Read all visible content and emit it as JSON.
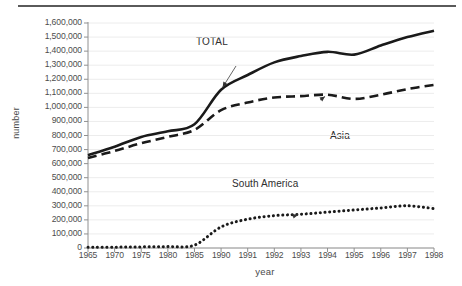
{
  "figure": {
    "has_top_rule": true,
    "background_color": "#ffffff",
    "line_color": "#1a1a1a",
    "grid_color": "#ececec",
    "axis_color": "#909090",
    "text_color": "#4d4d4d"
  },
  "chart_data": {
    "type": "line",
    "title": "",
    "xlabel": "year",
    "ylabel": "number",
    "grid": true,
    "legend_position": "inline-annotations",
    "ylim": [
      0,
      1600000
    ],
    "ytick_labels": [
      "1,600,000",
      "1,500,000",
      "1,400,000",
      "1,300,000",
      "1,200,000",
      "1,100,000",
      "1,000,000",
      "900,000",
      "800,000",
      "700,000",
      "600,000",
      "500,000",
      "400,000",
      "300,000",
      "200,000",
      "100,000",
      "0"
    ],
    "ytick_values": [
      1600000,
      1500000,
      1400000,
      1300000,
      1200000,
      1100000,
      1000000,
      900000,
      800000,
      700000,
      600000,
      500000,
      400000,
      300000,
      200000,
      100000,
      0
    ],
    "categories": [
      "1965",
      "1970",
      "1975",
      "1980",
      "1985",
      "1990",
      "1991",
      "1992",
      "1993",
      "1994",
      "1995",
      "1996",
      "1997",
      "1998"
    ],
    "x": [
      1965,
      1970,
      1975,
      1980,
      1985,
      1990,
      1991,
      1992,
      1993,
      1994,
      1995,
      1996,
      1997,
      1998
    ],
    "series": [
      {
        "name": "TOTAL",
        "style": "solid",
        "values": [
          660000,
          720000,
          790000,
          830000,
          880000,
          1125000,
          1230000,
          1320000,
          1365000,
          1395000,
          1375000,
          1440000,
          1500000,
          1545000
        ]
      },
      {
        "name": "Asia",
        "style": "dashed",
        "values": [
          640000,
          690000,
          745000,
          790000,
          840000,
          980000,
          1035000,
          1070000,
          1080000,
          1090000,
          1060000,
          1090000,
          1130000,
          1160000
        ]
      },
      {
        "name": "South America",
        "style": "dotted",
        "values": [
          5000,
          6000,
          8000,
          10000,
          20000,
          150000,
          205000,
          230000,
          240000,
          255000,
          270000,
          285000,
          300000,
          280000
        ]
      }
    ],
    "annotations": [
      {
        "label": "TOTAL",
        "target_series": "TOTAL",
        "target_year": 1990
      },
      {
        "label": "Asia",
        "target_series": "Asia",
        "target_year": 1994
      },
      {
        "label": "South America",
        "target_series": "South America",
        "target_year": 1993
      }
    ]
  }
}
